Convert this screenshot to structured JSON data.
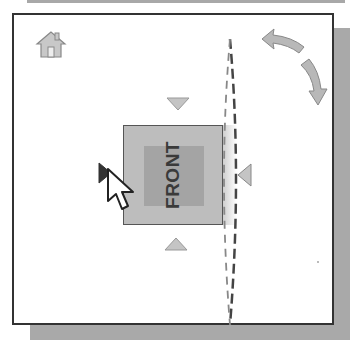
{
  "viewcube": {
    "face_label": "FRONT",
    "icons": {
      "home": "home-icon",
      "rotate_ccw": "rotate-arrow-top-icon",
      "rotate_cw": "rotate-arrow-right-icon",
      "arrow_up": "triangle-down-icon",
      "arrow_down": "triangle-up-icon",
      "arrow_left": "triangle-right-icon",
      "arrow_right": "triangle-left-icon",
      "cursor": "mouse-pointer-icon"
    },
    "colors": {
      "face": "#bdbdbd",
      "face_inner": "#a4a4a4",
      "border": "#333333",
      "shadow": "#a9a9a9",
      "icon": "#b5b5b5"
    }
  }
}
